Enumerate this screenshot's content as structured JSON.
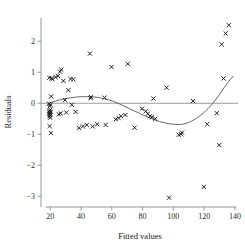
{
  "chart_data": {
    "type": "scatter",
    "title": "",
    "xlabel": "Fitted values",
    "ylabel": "Residuals",
    "xlim": [
      14,
      142
    ],
    "ylim": [
      -3.35,
      2.75
    ],
    "xticks": [
      20,
      40,
      60,
      80,
      100,
      120,
      140
    ],
    "yticks": [
      2,
      1,
      0,
      -1,
      -2,
      -3
    ],
    "xticklabels": [
      "20",
      "40",
      "60",
      "80",
      "100",
      "120",
      "140"
    ],
    "yticklabels": [
      "2",
      "1",
      "0",
      "−1",
      "−2",
      "−3"
    ],
    "grid": false,
    "legend": null,
    "marker": "x",
    "marker_color": "#1a1a1a",
    "reference_line": {
      "type": "horizontal",
      "y": 0,
      "color": "#9a9a9a"
    },
    "smoother": {
      "name": "lowess",
      "color": "#555555",
      "points": [
        [
          19,
          0.0
        ],
        [
          22,
          0.05
        ],
        [
          25,
          0.09
        ],
        [
          28,
          0.13
        ],
        [
          31,
          0.16
        ],
        [
          34,
          0.18
        ],
        [
          37,
          0.2
        ],
        [
          40,
          0.21
        ],
        [
          43,
          0.21
        ],
        [
          46,
          0.21
        ],
        [
          49,
          0.2
        ],
        [
          52,
          0.18
        ],
        [
          55,
          0.15
        ],
        [
          58,
          0.11
        ],
        [
          61,
          0.06
        ],
        [
          64,
          0.0
        ],
        [
          67,
          -0.07
        ],
        [
          70,
          -0.14
        ],
        [
          73,
          -0.21
        ],
        [
          76,
          -0.28
        ],
        [
          79,
          -0.35
        ],
        [
          82,
          -0.42
        ],
        [
          85,
          -0.48
        ],
        [
          88,
          -0.54
        ],
        [
          91,
          -0.59
        ],
        [
          94,
          -0.63
        ],
        [
          97,
          -0.66
        ],
        [
          100,
          -0.68
        ],
        [
          103,
          -0.69
        ],
        [
          106,
          -0.68
        ],
        [
          109,
          -0.64
        ],
        [
          112,
          -0.58
        ],
        [
          115,
          -0.49
        ],
        [
          118,
          -0.38
        ],
        [
          121,
          -0.25
        ],
        [
          124,
          -0.1
        ],
        [
          127,
          0.08
        ],
        [
          130,
          0.28
        ],
        [
          133,
          0.5
        ],
        [
          136,
          0.71
        ],
        [
          139,
          0.88
        ]
      ]
    },
    "points": [
      [
        19.2,
        -0.02
      ],
      [
        19.3,
        -0.3
      ],
      [
        19.4,
        -0.36
      ],
      [
        19.5,
        -0.25
      ],
      [
        19.6,
        -0.42
      ],
      [
        19.7,
        -0.1
      ],
      [
        19.8,
        -0.33
      ],
      [
        19.9,
        -0.47
      ],
      [
        20.0,
        -0.21
      ],
      [
        20.1,
        -0.38
      ],
      [
        20.2,
        -0.05
      ],
      [
        20.3,
        -0.28
      ],
      [
        19.4,
        0.82
      ],
      [
        20.8,
        0.8
      ],
      [
        21.5,
        0.78
      ],
      [
        20.6,
        0.22
      ],
      [
        19.6,
        -0.74
      ],
      [
        20.4,
        -0.96
      ],
      [
        23.5,
        0.84
      ],
      [
        25.0,
        0.88
      ],
      [
        26.3,
        1.02
      ],
      [
        27.2,
        1.08
      ],
      [
        25.6,
        -0.36
      ],
      [
        26.8,
        -0.33
      ],
      [
        28.5,
        0.72
      ],
      [
        29.6,
        0.1
      ],
      [
        30.4,
        -0.3
      ],
      [
        31.8,
        0.42
      ],
      [
        33.2,
        0.78
      ],
      [
        35.0,
        0.77
      ],
      [
        34.0,
        -0.05
      ],
      [
        36.5,
        -0.28
      ],
      [
        38.6,
        -0.8
      ],
      [
        41.2,
        -0.75
      ],
      [
        43.8,
        -0.7
      ],
      [
        45.8,
        1.6
      ],
      [
        46.2,
        0.16
      ],
      [
        46.4,
        0.2
      ],
      [
        47.6,
        -0.75
      ],
      [
        50.5,
        -0.68
      ],
      [
        55.2,
        0.18
      ],
      [
        56.0,
        -0.7
      ],
      [
        59.8,
        1.17
      ],
      [
        62.6,
        -0.52
      ],
      [
        64.4,
        -0.48
      ],
      [
        66.0,
        -0.42
      ],
      [
        68.8,
        -0.38
      ],
      [
        70.4,
        1.27
      ],
      [
        74.8,
        -0.79
      ],
      [
        79.6,
        -0.18
      ],
      [
        82.0,
        -0.26
      ],
      [
        83.4,
        -0.34
      ],
      [
        84.8,
        -0.42
      ],
      [
        86.0,
        -0.45
      ],
      [
        87.0,
        0.15
      ],
      [
        88.2,
        -0.5
      ],
      [
        95.6,
        0.5
      ],
      [
        97.2,
        -3.05
      ],
      [
        103.5,
        -1.02
      ],
      [
        105.0,
        -1.0
      ],
      [
        105.6,
        -0.95
      ],
      [
        112.8,
        0.07
      ],
      [
        119.8,
        -2.7
      ],
      [
        122.0,
        -0.68
      ],
      [
        128.2,
        -0.32
      ],
      [
        129.8,
        -1.35
      ],
      [
        131.4,
        1.9
      ],
      [
        132.6,
        0.8
      ],
      [
        134.0,
        2.25
      ],
      [
        136.0,
        2.52
      ]
    ]
  }
}
